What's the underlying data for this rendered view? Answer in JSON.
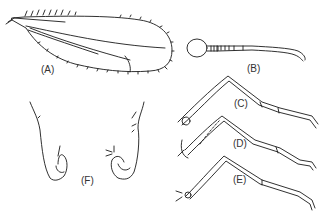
{
  "figure": {
    "panels": [
      {
        "id": "A",
        "label": "(A)",
        "subject": "wing"
      },
      {
        "id": "B",
        "label": "(B)",
        "subject": "antenna"
      },
      {
        "id": "C",
        "label": "(C)",
        "subject": "leg"
      },
      {
        "id": "D",
        "label": "(D)",
        "subject": "leg"
      },
      {
        "id": "E",
        "label": "(E)",
        "subject": "leg"
      },
      {
        "id": "F",
        "label": "(F)",
        "subject": "genitalia"
      }
    ],
    "colors": {
      "line": "#1a1a1a",
      "background": "#ffffff"
    }
  }
}
